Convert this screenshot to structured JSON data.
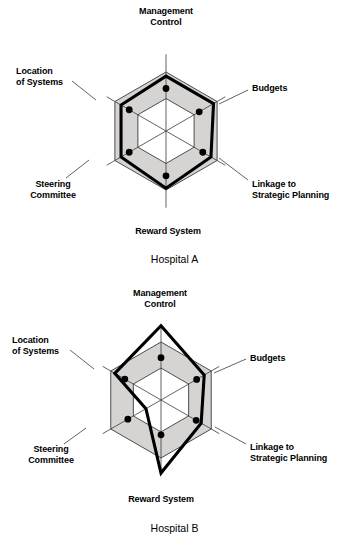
{
  "axes": [
    {
      "key": "management_control",
      "label": "Management\nControl",
      "angle_deg": 90
    },
    {
      "key": "budgets",
      "label": "Budgets",
      "angle_deg": 30
    },
    {
      "key": "linkage",
      "label": "Linkage to\nStrategic Planning",
      "angle_deg": -30
    },
    {
      "key": "reward_system",
      "label": "Reward System",
      "angle_deg": -90
    },
    {
      "key": "steering_committee",
      "label": "Steering\nCommittee",
      "angle_deg": -150
    },
    {
      "key": "location_of_systems",
      "label": "Location\nof Systems",
      "angle_deg": 150
    }
  ],
  "colors": {
    "band_fill": "#d6d4d2",
    "grid_line": "#3a3a3a",
    "data_line": "#000000",
    "marker": "#000000",
    "background": "#ffffff"
  },
  "chart_data": [
    {
      "type": "radar",
      "title": "Hospital A",
      "categories": [
        "Management Control",
        "Budgets",
        "Linkage to Strategic Planning",
        "Reward System",
        "Steering Committee",
        "Location of Systems"
      ],
      "series": [
        {
          "name": "Hospital A",
          "values": [
            0.93,
            0.93,
            0.88,
            0.97,
            0.88,
            0.88
          ],
          "marker_values": [
            0.72,
            0.65,
            0.72,
            0.76,
            0.72,
            0.72
          ]
        }
      ],
      "grid": {
        "rings": [
          0.55,
          1.0
        ],
        "band_between_rings": true,
        "axis_lines": true
      },
      "rmax": 1.3,
      "legend": "none"
    },
    {
      "type": "radar",
      "title": "Hospital B",
      "categories": [
        "Management Control",
        "Budgets",
        "Linkage to Strategic Planning",
        "Reward System",
        "Steering Committee",
        "Location of Systems"
      ],
      "series": [
        {
          "name": "Hospital B",
          "values": [
            1.28,
            0.86,
            0.8,
            1.26,
            0.3,
            0.92
          ],
          "marker_values": [
            0.73,
            0.71,
            0.7,
            0.6,
            0.66,
            0.72
          ]
        }
      ],
      "grid": {
        "rings": [
          0.55,
          1.0
        ],
        "band_between_rings": true,
        "axis_lines": true
      },
      "rmax": 1.3,
      "legend": "none"
    }
  ],
  "charts": [
    {
      "id": "hospital-a",
      "caption": "Hospital A",
      "center": {
        "x": 166,
        "y": 131
      },
      "radius": 59,
      "label_positions": [
        {
          "key": "management_control",
          "x": 128,
          "y": 6,
          "w": 76,
          "cls": "al-top"
        },
        {
          "key": "budgets",
          "x": 252,
          "y": 83,
          "w": 70,
          "cls": "al-upper-right"
        },
        {
          "key": "linkage",
          "x": 252,
          "y": 179,
          "w": 96,
          "cls": "al-lower-right"
        },
        {
          "key": "reward_system",
          "x": 113,
          "y": 226,
          "w": 110,
          "cls": "al-bottom"
        },
        {
          "key": "steering_committee",
          "x": 14,
          "y": 179,
          "w": 78,
          "cls": "al-lower-left"
        },
        {
          "key": "location_of_systems",
          "x": 16,
          "y": 66,
          "w": 78,
          "cls": "al-upper-left"
        }
      ],
      "leaders": [
        {
          "key": "budgets",
          "x1": 248,
          "y1": 90,
          "x2": 219,
          "y2": 104
        },
        {
          "key": "linkage",
          "x1": 248,
          "y1": 180,
          "x2": 219,
          "y2": 158
        },
        {
          "key": "steering_committee",
          "x1": 66,
          "y1": 178,
          "x2": 89,
          "y2": 160
        },
        {
          "key": "location_of_systems",
          "x1": 72,
          "y1": 81,
          "x2": 96,
          "y2": 100
        }
      ]
    },
    {
      "id": "hospital-b",
      "caption": "Hospital B",
      "center": {
        "x": 161,
        "y": 400
      },
      "radius": 58,
      "label_positions": [
        {
          "key": "management_control",
          "x": 122,
          "y": 288,
          "w": 76,
          "cls": "al-top"
        },
        {
          "key": "budgets",
          "x": 250,
          "y": 353,
          "w": 70,
          "cls": "al-upper-right"
        },
        {
          "key": "linkage",
          "x": 250,
          "y": 442,
          "w": 96,
          "cls": "al-lower-right"
        },
        {
          "key": "reward_system",
          "x": 106,
          "y": 494,
          "w": 110,
          "cls": "al-bottom"
        },
        {
          "key": "steering_committee",
          "x": 12,
          "y": 444,
          "w": 78,
          "cls": "al-lower-left"
        },
        {
          "key": "location_of_systems",
          "x": 12,
          "y": 335,
          "w": 78,
          "cls": "al-upper-left"
        }
      ],
      "leaders": [
        {
          "key": "budgets",
          "x1": 246,
          "y1": 359,
          "x2": 214,
          "y2": 373
        },
        {
          "key": "linkage",
          "x1": 246,
          "y1": 444,
          "x2": 215,
          "y2": 427
        },
        {
          "key": "steering_committee",
          "x1": 64,
          "y1": 444,
          "x2": 86,
          "y2": 428
        },
        {
          "key": "location_of_systems",
          "x1": 70,
          "y1": 350,
          "x2": 94,
          "y2": 369
        }
      ]
    }
  ],
  "captions": {
    "hospital_a": {
      "text": "Hospital A",
      "y": 253
    },
    "hospital_b": {
      "text": "Hospital B",
      "y": 522
    }
  }
}
